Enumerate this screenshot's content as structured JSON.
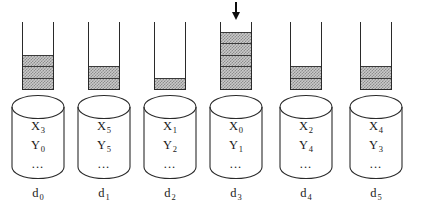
{
  "figure": {
    "type": "system-diagram",
    "beaker_capacity": 5,
    "fill_glyph": "checkerboard-gray",
    "arrow_icon": "down-arrow-icon",
    "cylinder_icon": "database-cylinder-icon"
  },
  "colors": {
    "outline": "#2a2a2a",
    "fill_light": "#c9c9c9",
    "fill_dark": "#8d8d8d",
    "arrow": "#0d0d0d",
    "text": "#1a1a1a",
    "background": "#ffffff"
  },
  "nodes": [
    {
      "id": "d0",
      "caption": "d",
      "caption_sub": "0",
      "buffer_filled": 3,
      "arrow": false,
      "rows": [
        {
          "label": "X",
          "sub": "3"
        },
        {
          "label": "Y",
          "sub": "0"
        }
      ],
      "ellipsis": "..."
    },
    {
      "id": "d1",
      "caption": "d",
      "caption_sub": "1",
      "buffer_filled": 2,
      "arrow": false,
      "rows": [
        {
          "label": "X",
          "sub": "5"
        },
        {
          "label": "Y",
          "sub": "5"
        }
      ],
      "ellipsis": "..."
    },
    {
      "id": "d2",
      "caption": "d",
      "caption_sub": "2",
      "buffer_filled": 1,
      "arrow": false,
      "rows": [
        {
          "label": "X",
          "sub": "1"
        },
        {
          "label": "Y",
          "sub": "2"
        }
      ],
      "ellipsis": "..."
    },
    {
      "id": "d3",
      "caption": "d",
      "caption_sub": "3",
      "buffer_filled": 5,
      "arrow": true,
      "rows": [
        {
          "label": "X",
          "sub": "0"
        },
        {
          "label": "Y",
          "sub": "1"
        }
      ],
      "ellipsis": "..."
    },
    {
      "id": "d4",
      "caption": "d",
      "caption_sub": "4",
      "buffer_filled": 2,
      "arrow": false,
      "rows": [
        {
          "label": "X",
          "sub": "2"
        },
        {
          "label": "Y",
          "sub": "4"
        }
      ],
      "ellipsis": "..."
    },
    {
      "id": "d5",
      "caption": "d",
      "caption_sub": "5",
      "buffer_filled": 2,
      "arrow": false,
      "rows": [
        {
          "label": "X",
          "sub": "4"
        },
        {
          "label": "Y",
          "sub": "3"
        }
      ],
      "ellipsis": "..."
    }
  ]
}
